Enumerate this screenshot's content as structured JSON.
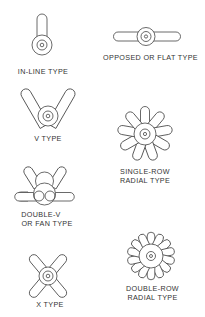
{
  "diagram": {
    "items": [
      {
        "id": "in-line",
        "label": "IN-LINE TYPE"
      },
      {
        "id": "opposed",
        "label": "OPPOSED OR FLAT TYPE"
      },
      {
        "id": "v",
        "label": "V TYPE"
      },
      {
        "id": "single-row-radial",
        "label_line1": "SINGLE-ROW",
        "label_line2": "RADIAL TYPE"
      },
      {
        "id": "double-v",
        "label_line1": "DOUBLE-V",
        "label_line2": "OR FAN TYPE"
      },
      {
        "id": "x",
        "label": "X TYPE"
      },
      {
        "id": "double-row-radial",
        "label_line1": "DOUBLE-ROW",
        "label_line2": "RADIAL TYPE"
      }
    ],
    "colors": {
      "line": "#444444",
      "text": "#333333",
      "background": "#ffffff"
    }
  }
}
